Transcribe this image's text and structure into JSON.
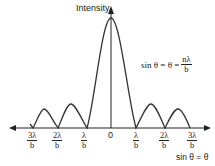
{
  "diagram": {
    "y_axis_label": "Intensity",
    "x_axis_label": "sin θ = θ",
    "formula": {
      "lhs": "sin θ = θ =",
      "numerator": "nλ",
      "denominator": "b"
    },
    "center_tick": "0",
    "ticks": [
      {
        "numerator": "3λ",
        "denominator": "b",
        "side": "left"
      },
      {
        "numerator": "2λ",
        "denominator": "b",
        "side": "left"
      },
      {
        "numerator": "λ",
        "denominator": "b",
        "side": "left"
      },
      {
        "numerator": "λ",
        "denominator": "b",
        "side": "right"
      },
      {
        "numerator": "2λ",
        "denominator": "b",
        "side": "right"
      },
      {
        "numerator": "3λ",
        "denominator": "b",
        "side": "right"
      }
    ],
    "colors": {
      "curve": "#333333",
      "axes": "#222222",
      "background": "#ffffff"
    }
  }
}
